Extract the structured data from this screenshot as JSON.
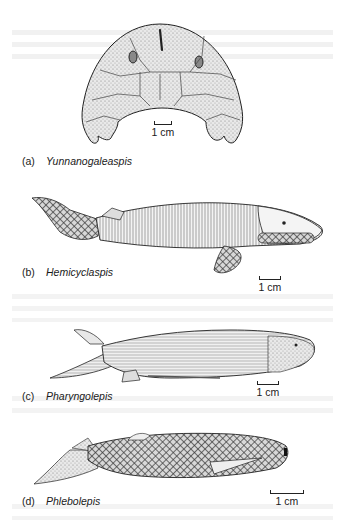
{
  "figure": {
    "panels": [
      {
        "letter": "(a)",
        "name": "Yunnanogaleaspis",
        "scale": "1 cm",
        "view": "dorsal head shield"
      },
      {
        "letter": "(b)",
        "name": "Hemicyclaspis",
        "scale": "1 cm",
        "view": "lateral"
      },
      {
        "letter": "(c)",
        "name": "Pharyngolepis",
        "scale": "1 cm",
        "view": "lateral"
      },
      {
        "letter": "(d)",
        "name": "Phlebolepis",
        "scale": "1 cm",
        "view": "lateral"
      }
    ],
    "colors": {
      "ink": "#1a1a1a",
      "stipple": "#9a9a9a",
      "paper": "#ffffff",
      "bleed_through": "#ececec"
    }
  }
}
